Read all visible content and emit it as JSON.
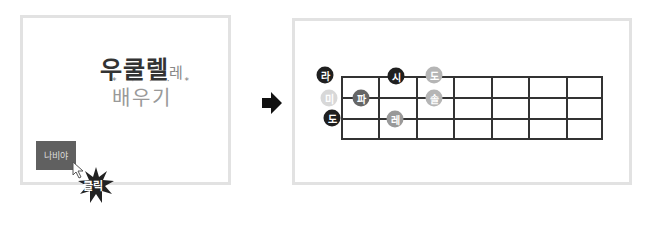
{
  "left_panel": {
    "title_line1": "우쿨렐",
    "title_line1_small": "레",
    "title_line2": "배우기",
    "stars": "* · · · *",
    "nav_button_label": "나비야",
    "click_badge_label": "클릭"
  },
  "arrow_icon": "right-arrow",
  "right_panel": {
    "fretboard": {
      "columns": 7,
      "rows": 3
    },
    "notes": [
      {
        "label": "라",
        "x": 325,
        "y": 75,
        "color": "#1f1f1f"
      },
      {
        "label": "미",
        "x": 329,
        "y": 98,
        "color": "#d8d8d8"
      },
      {
        "label": "도",
        "x": 332,
        "y": 118,
        "color": "#1f1f1f"
      },
      {
        "label": "파",
        "x": 361,
        "y": 98,
        "color": "#666666"
      },
      {
        "label": "시",
        "x": 396,
        "y": 76,
        "color": "#1f1f1f"
      },
      {
        "label": "레",
        "x": 395,
        "y": 119,
        "color": "#999999"
      },
      {
        "label": "도",
        "x": 434,
        "y": 75,
        "color": "#b5b5b5"
      },
      {
        "label": "솔",
        "x": 434,
        "y": 98,
        "color": "#b5b5b5"
      }
    ]
  }
}
